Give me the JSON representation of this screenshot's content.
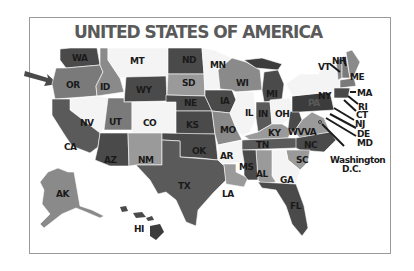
{
  "title": "UNITED STATES OF AMERICA",
  "colors": {
    "dark": "#4a4a4a",
    "darker": "#3c3c3c",
    "mid": "#7a7a7a",
    "midlight": "#9a9a9a",
    "light": "#f4f4f4",
    "frame": "#9a9a9a",
    "title": "#5a5a5a"
  },
  "states": [
    {
      "abbr": "WA"
    },
    {
      "abbr": "OR"
    },
    {
      "abbr": "ID"
    },
    {
      "abbr": "MT"
    },
    {
      "abbr": "WY"
    },
    {
      "abbr": "ND"
    },
    {
      "abbr": "SD"
    },
    {
      "abbr": "NE"
    },
    {
      "abbr": "KS"
    },
    {
      "abbr": "MN"
    },
    {
      "abbr": "IA"
    },
    {
      "abbr": "MO"
    },
    {
      "abbr": "WI"
    },
    {
      "abbr": "IL"
    },
    {
      "abbr": "MI"
    },
    {
      "abbr": "IN"
    },
    {
      "abbr": "OH"
    },
    {
      "abbr": "KY"
    },
    {
      "abbr": "WV"
    },
    {
      "abbr": "VA"
    },
    {
      "abbr": "PA"
    },
    {
      "abbr": "NY"
    },
    {
      "abbr": "VT"
    },
    {
      "abbr": "NH"
    },
    {
      "abbr": "ME"
    },
    {
      "abbr": "MA"
    },
    {
      "abbr": "RI"
    },
    {
      "abbr": "CT"
    },
    {
      "abbr": "NJ"
    },
    {
      "abbr": "DE"
    },
    {
      "abbr": "MD"
    },
    {
      "abbr": "NV"
    },
    {
      "abbr": "UT"
    },
    {
      "abbr": "CO"
    },
    {
      "abbr": "CA"
    },
    {
      "abbr": "AZ"
    },
    {
      "abbr": "NM"
    },
    {
      "abbr": "OK"
    },
    {
      "abbr": "TX"
    },
    {
      "abbr": "AR"
    },
    {
      "abbr": "LA"
    },
    {
      "abbr": "MS"
    },
    {
      "abbr": "AL"
    },
    {
      "abbr": "TN"
    },
    {
      "abbr": "NC"
    },
    {
      "abbr": "SC"
    },
    {
      "abbr": "GA"
    },
    {
      "abbr": "FL"
    },
    {
      "abbr": "AK"
    },
    {
      "abbr": "HI"
    }
  ],
  "dc_label": {
    "line1": "Washington",
    "line2": "D.C."
  }
}
